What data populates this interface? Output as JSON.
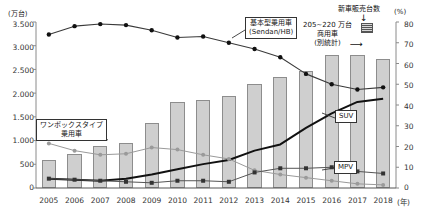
{
  "chart_data": {
    "type": "bar",
    "title": "",
    "xlabel": "(年)",
    "ylabel": "(万台)",
    "y2label": "(%)",
    "ylim": [
      0,
      3500
    ],
    "y2lim": [
      0,
      80
    ],
    "grid": false,
    "legend_position": "inline-callouts",
    "categories": [
      "2005",
      "2006",
      "2007",
      "2008",
      "2009",
      "2010",
      "2011",
      "2012",
      "2013",
      "2014",
      "2015",
      "2016",
      "2017",
      "2018"
    ],
    "yticks": [
      "0",
      "500",
      "1.000",
      "1.500",
      "2.000",
      "2.500",
      "3.000",
      "3.500"
    ],
    "y2ticks": [
      "0",
      "10",
      "20",
      "30",
      "40",
      "50",
      "60",
      "70",
      "80"
    ],
    "series": [
      {
        "name": "新車販売台数",
        "type": "bar",
        "axis": "left",
        "unit": "万台",
        "values": [
          580,
          710,
          880,
          940,
          1370,
          1810,
          1850,
          1930,
          2200,
          2350,
          2460,
          2800,
          2810,
          2720
        ]
      },
      {
        "name": "基本型乗用車(Sedan/HB)",
        "type": "line",
        "axis": "right",
        "unit": "%",
        "values": [
          74,
          78,
          79,
          78.5,
          76,
          72.5,
          73,
          70,
          67,
          63,
          55,
          50,
          47.5,
          48.5
        ]
      },
      {
        "name": "SUV",
        "type": "line",
        "axis": "right",
        "unit": "%",
        "values": [
          4.5,
          4,
          3.5,
          4.5,
          6.5,
          9,
          11.5,
          13.5,
          18,
          21,
          29,
          36,
          41.5,
          43
        ]
      },
      {
        "name": "ワンボックスタイプ乗用車",
        "type": "line",
        "axis": "right",
        "unit": "%",
        "values": [
          21.5,
          18,
          16,
          16.5,
          19.5,
          18.5,
          16,
          14,
          8.5,
          6.5,
          5,
          3.5,
          2,
          1.5
        ]
      },
      {
        "name": "MPV",
        "type": "line",
        "axis": "right",
        "unit": "%",
        "values": [
          4.5,
          4,
          3.5,
          3,
          2.5,
          3.5,
          3.5,
          3,
          7.5,
          9.5,
          9.5,
          10,
          8,
          7
        ]
      }
    ],
    "annotations": [
      {
        "name": "sedan-callout",
        "text_lines": [
          "基本型乗用車",
          "(Sendan/HB)"
        ],
        "boxed": true
      },
      {
        "name": "onebox-callout",
        "text_lines": [
          "ワンボックスタイプ",
          "乗用車"
        ],
        "boxed": true
      },
      {
        "name": "suv-callout",
        "text_lines": [
          "SUV"
        ],
        "boxed": true
      },
      {
        "name": "mpv-callout",
        "text_lines": [
          "MPV"
        ],
        "boxed": true
      },
      {
        "name": "commercial-vehicle-note",
        "text_lines": [
          "205~220 万台",
          "商用車",
          "(別統計)"
        ],
        "boxed": false
      },
      {
        "name": "new-car-sales-note",
        "text_lines": [
          "新車販売台数"
        ],
        "boxed": false
      }
    ]
  },
  "colors": {
    "bar_fill": "#cfcfcf",
    "bar_stroke": "#8d8d8d",
    "sedan_line": "#3a3a3a",
    "suv_line": "#111111",
    "onebox_line": "#9a9a9a",
    "mpv_line": "#555555",
    "axis": "#8a8a8a"
  }
}
